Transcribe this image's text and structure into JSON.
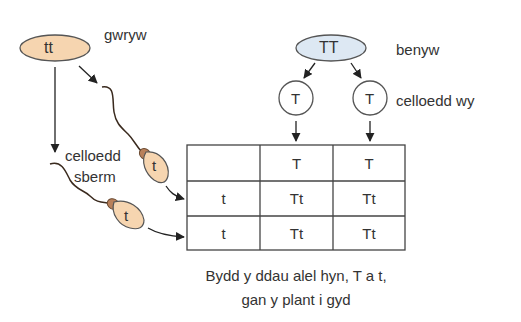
{
  "male": {
    "genotype": "tt",
    "label": "gwryw",
    "fill": "#f6d5b0",
    "gamete_label_line1": "celloedd",
    "gamete_label_line2": "sberm",
    "gametes": [
      "t",
      "t"
    ]
  },
  "female": {
    "genotype": "TT",
    "label": "benyw",
    "fill": "#dde8f3",
    "gamete_label": "celloedd wy",
    "gametes": [
      "T",
      "T"
    ]
  },
  "punnett": {
    "header": [
      "",
      "T",
      "T"
    ],
    "rows": [
      [
        "t",
        "Tt",
        "Tt"
      ],
      [
        "t",
        "Tt",
        "Tt"
      ]
    ]
  },
  "caption": {
    "line1": "Bydd y ddau alel hyn, T a t,",
    "line2": "gan y plant i gyd"
  },
  "colors": {
    "ink": "#333333",
    "sperm_head": "#f6d5b0",
    "sperm_midpiece": "#b9805a"
  }
}
